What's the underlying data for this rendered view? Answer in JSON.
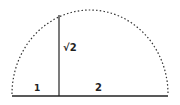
{
  "diagram": {
    "segments": [
      {
        "label": "1"
      },
      {
        "label": "2"
      }
    ],
    "height_label": "√2",
    "colors": {
      "stroke": "#222222",
      "background": "#ffffff"
    }
  }
}
